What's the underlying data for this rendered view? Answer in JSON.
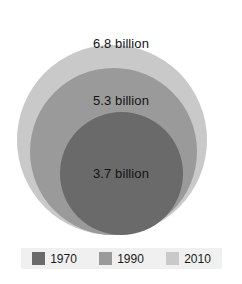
{
  "chart_data": {
    "type": "bubble",
    "title": "",
    "subtitle": "",
    "xlabel": "",
    "ylabel": "",
    "grid": false,
    "legend_position": "bottom",
    "layout": "nested-concentric-bottom-aligned",
    "unit": "billion",
    "categories": [
      "1970",
      "1990",
      "2010"
    ],
    "values": [
      3.7,
      5.3,
      6.8
    ],
    "series": [
      {
        "name": "1970",
        "value": 3.7,
        "label": "3.7 billion",
        "color": "#6a6a6a",
        "diameter_px": 123
      },
      {
        "name": "1990",
        "value": 5.3,
        "label": "5.3 billion",
        "color": "#9a9a9a",
        "diameter_px": 167
      },
      {
        "name": "2010",
        "value": 6.8,
        "label": "6.8 billion",
        "color": "#c9c9c9",
        "diameter_px": 190
      }
    ]
  },
  "bubbles": {
    "outer": {
      "label": "6.8 billion",
      "color": "#c9c9c9"
    },
    "middle": {
      "label": "5.3 billion",
      "color": "#9a9a9a"
    },
    "inner": {
      "label": "3.7 billion",
      "color": "#6a6a6a"
    }
  },
  "legend": {
    "items": [
      {
        "label": "1970",
        "color": "#6a6a6a"
      },
      {
        "label": "1990",
        "color": "#9a9a9a"
      },
      {
        "label": "2010",
        "color": "#c9c9c9"
      }
    ]
  }
}
